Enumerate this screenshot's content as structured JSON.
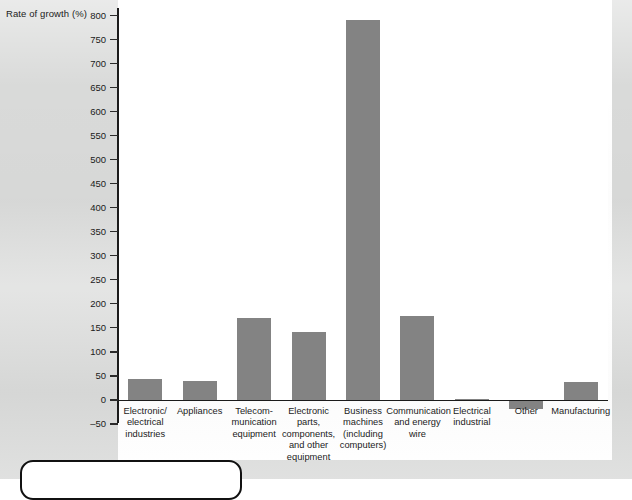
{
  "chart_data": {
    "type": "bar",
    "title": "",
    "subtitle": "",
    "xlabel": "",
    "ylabel": "Rate of growth (%)",
    "ylim": [
      -50,
      800
    ],
    "ytick_step": 50,
    "yticks": [
      800,
      750,
      700,
      650,
      600,
      550,
      500,
      450,
      400,
      350,
      300,
      250,
      200,
      150,
      100,
      50,
      0,
      -50
    ],
    "ytick_labels": [
      "800",
      "750",
      "700",
      "650",
      "600",
      "550",
      "500",
      "450",
      "400",
      "350",
      "300",
      "250",
      "200",
      "150",
      "100",
      "50",
      "0",
      "–50"
    ],
    "grid": false,
    "legend": null,
    "bar_color": "#838383",
    "axis_color": "#1b1b1b",
    "plot_background": "#ffffff",
    "page_background": "#d9dad9",
    "categories": [
      "Electronic/\nelectrical\nindustries",
      "Appliances",
      "Telecom-\nmunication\nequipment",
      "Electronic\nparts,\ncomponents,\nand other\nequipment",
      "Business\nmachines\n(including\ncomputers)",
      "Communication\nand energy\nwire",
      "Electrical\nindustrial",
      "Other",
      "Manufacturing"
    ],
    "values": [
      43,
      40,
      170,
      142,
      790,
      175,
      3,
      -18,
      37
    ]
  },
  "figure": {
    "axis_title": "Rate of growth (%)"
  }
}
